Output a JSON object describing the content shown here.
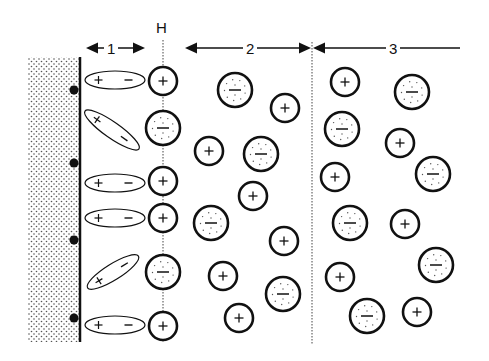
{
  "labels": {
    "h_plane": "H",
    "zone_1": "1",
    "zone_2": "2",
    "zone_3": "3"
  },
  "colors": {
    "ink": "#111111",
    "background": "#ffffff",
    "wall_dots": "#555555"
  },
  "wall": {
    "x": 28,
    "y": 57,
    "width": 52,
    "height": 285,
    "edge_x": 80,
    "surface_charges_y": [
      90,
      163,
      240,
      318
    ]
  },
  "h_line": {
    "x": 163,
    "y1": 40,
    "y2": 342
  },
  "boundary_line": {
    "x": 312,
    "y1": 42,
    "y2": 345
  },
  "dipoles": [
    {
      "cx": 115,
      "cy": 80,
      "rx": 30,
      "ry": 9,
      "angle": 0,
      "pos": "+",
      "neg": "−"
    },
    {
      "cx": 112,
      "cy": 130,
      "rx": 33,
      "ry": 8,
      "angle": 35,
      "pos": "+",
      "neg": "−"
    },
    {
      "cx": 115,
      "cy": 183,
      "rx": 30,
      "ry": 9,
      "angle": 0,
      "pos": "+",
      "neg": "−"
    },
    {
      "cx": 115,
      "cy": 218,
      "rx": 30,
      "ry": 9,
      "angle": 0,
      "pos": "+",
      "neg": "−"
    },
    {
      "cx": 113,
      "cy": 272,
      "rx": 30,
      "ry": 8,
      "angle": -32,
      "pos": "+",
      "neg": "−"
    },
    {
      "cx": 115,
      "cy": 325,
      "rx": 30,
      "ry": 9,
      "angle": 0,
      "pos": "+",
      "neg": "−"
    }
  ],
  "ions": [
    {
      "zone": "H",
      "type": "cation",
      "cx": 163,
      "cy": 81,
      "r": 14
    },
    {
      "zone": "H",
      "type": "anion",
      "cx": 163,
      "cy": 128,
      "r": 17
    },
    {
      "zone": "H",
      "type": "cation",
      "cx": 163,
      "cy": 181,
      "r": 14
    },
    {
      "zone": "H",
      "type": "cation",
      "cx": 163,
      "cy": 218,
      "r": 14
    },
    {
      "zone": "H",
      "type": "anion",
      "cx": 163,
      "cy": 272,
      "r": 17
    },
    {
      "zone": "H",
      "type": "cation",
      "cx": 163,
      "cy": 326,
      "r": 14
    },
    {
      "zone": "2",
      "type": "anion",
      "cx": 235,
      "cy": 90,
      "r": 17
    },
    {
      "zone": "2",
      "type": "cation",
      "cx": 285,
      "cy": 108,
      "r": 14
    },
    {
      "zone": "2",
      "type": "cation",
      "cx": 209,
      "cy": 151,
      "r": 14
    },
    {
      "zone": "2",
      "type": "anion",
      "cx": 261,
      "cy": 154,
      "r": 17
    },
    {
      "zone": "2",
      "type": "cation",
      "cx": 253,
      "cy": 196,
      "r": 14
    },
    {
      "zone": "2",
      "type": "anion",
      "cx": 211,
      "cy": 223,
      "r": 17
    },
    {
      "zone": "2",
      "type": "cation",
      "cx": 284,
      "cy": 241,
      "r": 14
    },
    {
      "zone": "2",
      "type": "cation",
      "cx": 223,
      "cy": 276,
      "r": 14
    },
    {
      "zone": "2",
      "type": "anion",
      "cx": 283,
      "cy": 294,
      "r": 17
    },
    {
      "zone": "2",
      "type": "cation",
      "cx": 239,
      "cy": 318,
      "r": 14
    },
    {
      "zone": "3",
      "type": "cation",
      "cx": 345,
      "cy": 82,
      "r": 14
    },
    {
      "zone": "3",
      "type": "anion",
      "cx": 412,
      "cy": 92,
      "r": 17
    },
    {
      "zone": "3",
      "type": "anion",
      "cx": 342,
      "cy": 129,
      "r": 17
    },
    {
      "zone": "3",
      "type": "cation",
      "cx": 400,
      "cy": 143,
      "r": 14
    },
    {
      "zone": "3",
      "type": "cation",
      "cx": 335,
      "cy": 177,
      "r": 14
    },
    {
      "zone": "3",
      "type": "anion",
      "cx": 433,
      "cy": 174,
      "r": 17
    },
    {
      "zone": "3",
      "type": "anion",
      "cx": 350,
      "cy": 223,
      "r": 17
    },
    {
      "zone": "3",
      "type": "cation",
      "cx": 405,
      "cy": 224,
      "r": 14
    },
    {
      "zone": "3",
      "type": "cation",
      "cx": 340,
      "cy": 277,
      "r": 14
    },
    {
      "zone": "3",
      "type": "anion",
      "cx": 436,
      "cy": 265,
      "r": 17
    },
    {
      "zone": "3",
      "type": "anion",
      "cx": 367,
      "cy": 316,
      "r": 17
    },
    {
      "zone": "3",
      "type": "cation",
      "cx": 417,
      "cy": 312,
      "r": 14
    }
  ],
  "zone_arrows": [
    {
      "zone": "1",
      "x1": 86,
      "x2": 145,
      "y": 48
    },
    {
      "zone": "2",
      "x1": 185,
      "x2": 311,
      "y": 48
    },
    {
      "zone": "3",
      "x1": 313,
      "x2": 460,
      "y": 48,
      "right_arrowhead": false
    }
  ]
}
